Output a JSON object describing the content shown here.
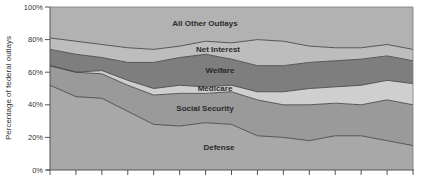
{
  "chart_data": {
    "type": "area",
    "stacked": true,
    "title": "",
    "xlabel": "",
    "ylabel": "Percentage of federal outlays",
    "ylim": [
      0,
      100
    ],
    "yticks": [
      "0%",
      "20%",
      "40%",
      "60%",
      "80%",
      "100%"
    ],
    "x": [
      1,
      2,
      3,
      4,
      5,
      6,
      7,
      8,
      9,
      10,
      11,
      12,
      13,
      14,
      15
    ],
    "x_tick_labels_visible": false,
    "grid": false,
    "legend": "inline labels",
    "series": [
      {
        "name": "Defense",
        "color": "#a8a8a8",
        "values": [
          52,
          45,
          44,
          36,
          28,
          27,
          29,
          28,
          21,
          20,
          18,
          21,
          21,
          18,
          15
        ]
      },
      {
        "name": "Social Security",
        "color": "#9a9a9a",
        "values": [
          12,
          15,
          15,
          16,
          18,
          20,
          18,
          20,
          22,
          20,
          22,
          20,
          19,
          25,
          25
        ]
      },
      {
        "name": "Medicare",
        "color": "#cfcfcf",
        "values": [
          0,
          0,
          2,
          3,
          4,
          5,
          4,
          4,
          5,
          8,
          10,
          10,
          12,
          12,
          13
        ]
      },
      {
        "name": "Welfare",
        "color": "#7e7e7e",
        "values": [
          10,
          11,
          8,
          11,
          16,
          17,
          20,
          16,
          16,
          16,
          16,
          16,
          16,
          15,
          14
        ]
      },
      {
        "name": "Net Interest",
        "color": "#bdbdbd",
        "values": [
          7,
          8,
          8,
          9,
          8,
          7,
          8,
          10,
          16,
          15,
          10,
          8,
          7,
          7,
          7
        ]
      },
      {
        "name": "All Other Outlays",
        "color": "#b2b2b2",
        "values": [
          19,
          21,
          23,
          25,
          26,
          24,
          21,
          22,
          20,
          21,
          24,
          25,
          25,
          23,
          26
        ]
      }
    ],
    "cumulative_tops": {
      "Defense": [
        52,
        45,
        44,
        36,
        28,
        27,
        29,
        28,
        21,
        20,
        18,
        21,
        21,
        18,
        15
      ],
      "Social Security": [
        64,
        60,
        59,
        52,
        46,
        47,
        47,
        48,
        43,
        40,
        40,
        41,
        40,
        43,
        40
      ],
      "Medicare": [
        64,
        60,
        61,
        55,
        50,
        52,
        51,
        52,
        48,
        48,
        50,
        51,
        52,
        55,
        53
      ],
      "Welfare": [
        74,
        71,
        69,
        66,
        66,
        69,
        71,
        68,
        64,
        64,
        66,
        67,
        68,
        70,
        67
      ],
      "Net Interest": [
        81,
        79,
        77,
        75,
        74,
        76,
        79,
        78,
        80,
        79,
        76,
        75,
        75,
        77,
        74
      ],
      "All Other Outlays": [
        100,
        100,
        100,
        100,
        100,
        100,
        100,
        100,
        100,
        100,
        100,
        100,
        100,
        100,
        100
      ]
    }
  },
  "labels": {
    "ylabel": "Percentage of federal outlays",
    "yticks": [
      "0%",
      "20%",
      "40%",
      "60%",
      "80%",
      "100%"
    ],
    "series": {
      "all_other": "All Other Outlays",
      "net_interest": "Net Interest",
      "welfare": "Welfare",
      "medicare": "Medicare",
      "social_security": "Social Security",
      "defense": "Defense"
    }
  }
}
